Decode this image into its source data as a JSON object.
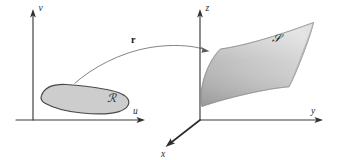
{
  "figure": {
    "background_color": "#ffffff"
  },
  "domain_panel": {
    "name": "uv-plane",
    "axes": [
      {
        "key": "u",
        "label": "u",
        "direction": "horizontal-right"
      },
      {
        "key": "v",
        "label": "v",
        "direction": "vertical-up"
      }
    ],
    "origin": {
      "x": 33,
      "y": 120
    },
    "region": {
      "label": "ℛ",
      "label_plain": "R",
      "fill_color": "#cdcdcd",
      "stroke_color": "#4a4a4a"
    }
  },
  "map": {
    "label": "r",
    "label_description": "vector-valued parametrization function",
    "arrow_color": "#6e6e6e"
  },
  "range_panel": {
    "name": "xyz-space",
    "axes": [
      {
        "key": "x",
        "label": "x",
        "direction": "down-left"
      },
      {
        "key": "y",
        "label": "y",
        "direction": "horizontal-right"
      },
      {
        "key": "z",
        "label": "z",
        "direction": "vertical-up"
      }
    ],
    "origin": {
      "x": 200,
      "y": 120
    },
    "surface": {
      "label": "𝒮",
      "label_plain": "S",
      "fill_light": "#e3e3e3",
      "fill_mid": "#bdbdbd",
      "fill_dark": "#a6a6a6",
      "stroke_color": "#8c8c8c"
    }
  },
  "colors": {
    "axis": "#2b2b2b",
    "ink": "#141414",
    "region_fill": "#cdcdcd",
    "surface_fill": "#bdbdbd",
    "paper": "#ffffff"
  }
}
